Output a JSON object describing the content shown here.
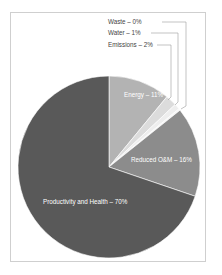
{
  "chart_data": {
    "type": "pie",
    "title": "",
    "start_angle_deg": 0,
    "direction": "clockwise",
    "slices": [
      {
        "label": "Energy",
        "value": 11,
        "display": "Energy – 11%",
        "color": "#b3b3b3"
      },
      {
        "label": "Emissions",
        "value": 2,
        "display": "Emissions – 2%",
        "color": "#dcdcdc"
      },
      {
        "label": "Water",
        "value": 1,
        "display": "Water – 1%",
        "color": "#eeeeee"
      },
      {
        "label": "Waste",
        "value": 0,
        "display": "Waste – 0%",
        "color": "#f5f5f5"
      },
      {
        "label": "Reduced O&M",
        "value": 16,
        "display": "Reduced O&M – 16%",
        "color": "#8c8c8c"
      },
      {
        "label": "Productivity and Health",
        "value": 70,
        "display": "Productivity and Health – 70%",
        "color": "#595959"
      }
    ]
  },
  "labels": {
    "waste": "Waste – 0%",
    "water": "Water – 1%",
    "emissions": "Emissions – 2%",
    "energy": "Energy – 11%",
    "om": "Reduced O&M – 16%",
    "productivity": "Productivity and Health – 70%"
  }
}
